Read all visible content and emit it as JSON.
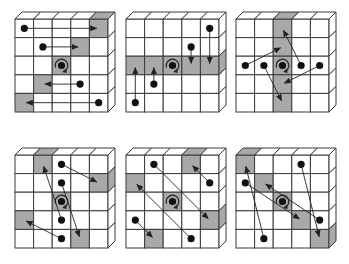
{
  "figure": {
    "grid_size": 5,
    "colors": {
      "background": "#ffffff",
      "grid_line": "#3a3a3a",
      "shaded_cell": "#a9a9a9",
      "dot": "#111111",
      "arrow": "#222222"
    },
    "panels": [
      {
        "id": "panel-1",
        "origin": [
          15,
          19
        ],
        "shaded": [
          [
            0,
            4
          ],
          [
            1,
            3
          ],
          [
            2,
            2
          ],
          [
            3,
            1
          ],
          [
            4,
            0
          ]
        ],
        "shaded_top": [
          4
        ],
        "shaded_side": [],
        "moves": [
          {
            "from": [
              0,
              0
            ],
            "to": [
              0,
              4
            ]
          },
          {
            "from": [
              1,
              1
            ],
            "to": [
              1,
              3
            ]
          },
          {
            "from": [
              3,
              3
            ],
            "to": [
              3,
              1
            ]
          },
          {
            "from": [
              4,
              4
            ],
            "to": [
              4,
              0
            ]
          }
        ],
        "center": [
          2,
          2
        ]
      },
      {
        "id": "panel-2",
        "origin": [
          126,
          19
        ],
        "shaded": [
          [
            2,
            0
          ],
          [
            2,
            1
          ],
          [
            2,
            2
          ],
          [
            2,
            3
          ],
          [
            2,
            4
          ]
        ],
        "shaded_top": [],
        "shaded_side": [
          2
        ],
        "moves": [
          {
            "from": [
              0,
              4
            ],
            "to": [
              2,
              4
            ]
          },
          {
            "from": [
              1,
              3
            ],
            "to": [
              2,
              3
            ]
          },
          {
            "from": [
              3,
              1
            ],
            "to": [
              2,
              1
            ]
          },
          {
            "from": [
              4,
              0
            ],
            "to": [
              2,
              0
            ]
          }
        ],
        "center": [
          2,
          2
        ]
      },
      {
        "id": "panel-3",
        "origin": [
          236,
          19
        ],
        "shaded": [
          [
            0,
            2
          ],
          [
            1,
            2
          ],
          [
            2,
            2
          ],
          [
            3,
            2
          ],
          [
            4,
            2
          ]
        ],
        "shaded_top": [
          2
        ],
        "shaded_side": [],
        "moves": [
          {
            "from": [
              2,
              0
            ],
            "to": [
              1,
              2
            ]
          },
          {
            "from": [
              2,
              1
            ],
            "to": [
              4,
              2
            ]
          },
          {
            "from": [
              2,
              3
            ],
            "to": [
              0,
              2
            ]
          },
          {
            "from": [
              2,
              4
            ],
            "to": [
              3,
              2
            ]
          }
        ],
        "center": [
          2,
          2
        ]
      },
      {
        "id": "panel-4",
        "origin": [
          15,
          155
        ],
        "shaded": [
          [
            0,
            1
          ],
          [
            1,
            4
          ],
          [
            2,
            2
          ],
          [
            3,
            0
          ],
          [
            4,
            3
          ]
        ],
        "shaded_top": [
          1
        ],
        "shaded_side": [
          1
        ],
        "moves": [
          {
            "from": [
              0,
              2
            ],
            "to": [
              1,
              4
            ]
          },
          {
            "from": [
              1,
              2
            ],
            "to": [
              4,
              3
            ]
          },
          {
            "from": [
              3,
              2
            ],
            "to": [
              0,
              1
            ]
          },
          {
            "from": [
              4,
              2
            ],
            "to": [
              3,
              0
            ]
          }
        ],
        "center": [
          2,
          2
        ]
      },
      {
        "id": "panel-5",
        "origin": [
          126,
          155
        ],
        "shaded": [
          [
            0,
            3
          ],
          [
            1,
            0
          ],
          [
            2,
            2
          ],
          [
            3,
            4
          ],
          [
            4,
            1
          ]
        ],
        "shaded_top": [
          3
        ],
        "shaded_side": [
          3
        ],
        "moves": [
          {
            "from": [
              0,
              1
            ],
            "to": [
              3,
              4
            ]
          },
          {
            "from": [
              1,
              4
            ],
            "to": [
              0,
              3
            ]
          },
          {
            "from": [
              3,
              0
            ],
            "to": [
              4,
              1
            ]
          },
          {
            "from": [
              4,
              3
            ],
            "to": [
              1,
              0
            ]
          }
        ],
        "center": [
          2,
          2
        ]
      },
      {
        "id": "panel-6",
        "origin": [
          236,
          155
        ],
        "shaded": [
          [
            0,
            0
          ],
          [
            1,
            1
          ],
          [
            2,
            2
          ],
          [
            3,
            3
          ],
          [
            4,
            4
          ]
        ],
        "shaded_top": [
          0
        ],
        "shaded_side": [
          4
        ],
        "moves": [
          {
            "from": [
              0,
              3
            ],
            "to": [
              4,
              4
            ]
          },
          {
            "from": [
              1,
              0
            ],
            "to": [
              3,
              3
            ]
          },
          {
            "from": [
              3,
              4
            ],
            "to": [
              1,
              1
            ]
          },
          {
            "from": [
              4,
              1
            ],
            "to": [
              0,
              0
            ]
          }
        ],
        "center": [
          2,
          2
        ]
      }
    ]
  }
}
